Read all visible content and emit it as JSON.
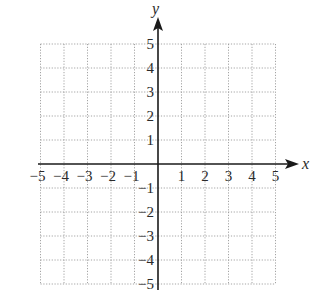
{
  "chart_data": {
    "type": "coordinate-grid",
    "title": "",
    "xlabel": "x",
    "ylabel": "y",
    "xlim": [
      -5,
      5
    ],
    "ylim": [
      -5,
      5
    ],
    "grid": "dotted",
    "x_ticks": [
      "-5",
      "-4",
      "-3",
      "-2",
      "-1",
      "1",
      "2",
      "3",
      "4",
      "5"
    ],
    "y_ticks": [
      "5",
      "4",
      "3",
      "2",
      "1",
      "-1",
      "-2",
      "-3",
      "-4",
      "-5"
    ],
    "x_tick_values": [
      -5,
      -4,
      -3,
      -2,
      -1,
      1,
      2,
      3,
      4,
      5
    ],
    "y_tick_values": [
      5,
      4,
      3,
      2,
      1,
      -1,
      -2,
      -3,
      -4,
      -5
    ],
    "data": []
  },
  "axes": {
    "x_label": "x",
    "y_label": "y"
  },
  "colors": {
    "axis": "#1a1a1a",
    "grid": "#9a9a9a",
    "text": "#2a2a2a"
  }
}
